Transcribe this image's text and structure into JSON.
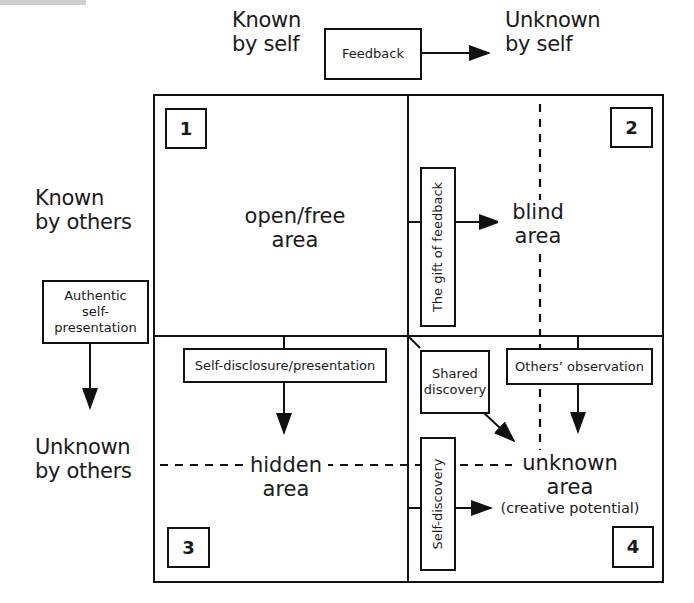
{
  "header": {
    "known_by_self": [
      "Known",
      "by self"
    ],
    "unknown_by_self": [
      "Unknown",
      "by self"
    ],
    "feedback_box": "Feedback"
  },
  "side": {
    "known_by_others": [
      "Known",
      "by others"
    ],
    "unknown_by_others": [
      "Unknown",
      "by others"
    ],
    "authentic_box": [
      "Authentic",
      "self-",
      "presentation"
    ]
  },
  "quadrants": [
    {
      "number": "1",
      "name": [
        "open/free",
        "area"
      ]
    },
    {
      "number": "2",
      "name": [
        "blind",
        "area"
      ]
    },
    {
      "number": "3",
      "name": [
        "hidden",
        "area"
      ]
    },
    {
      "number": "4",
      "name": [
        "unknown",
        "area"
      ],
      "note": "(creative potential)"
    }
  ],
  "process_boxes": {
    "gift_of_feedback": "The gift of feedback",
    "self_disclosure": "Self-disclosure/presentation",
    "shared_discovery": [
      "Shared",
      "discovery"
    ],
    "others_observation": "Others’ observation",
    "self_discovery": "Self-discovery"
  },
  "colors": {
    "line": "#111111",
    "background": "#ffffff",
    "text": "#1a1a1a"
  }
}
